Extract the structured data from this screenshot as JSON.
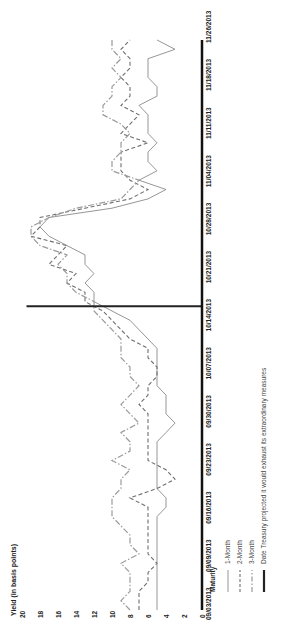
{
  "chart_data": {
    "type": "line",
    "title": "",
    "ylabel": "Yield (in basis points)",
    "xlabel": "",
    "ylim": [
      0,
      20
    ],
    "yticks": [
      0,
      2,
      4,
      6,
      8,
      10,
      12,
      14,
      16,
      18,
      20
    ],
    "grid": false,
    "orientation": "rotated -90deg (page rotated counter-clockwise)",
    "x_tick_labels": [
      "09/03/2013",
      "09/09/2013",
      "09/16/2013",
      "09/23/2013",
      "09/30/2013",
      "10/07/2013",
      "10/14/2013",
      "10/21/2013",
      "10/28/2013",
      "11/04/2013",
      "11/11/2013",
      "11/18/2013",
      "11/26/2013"
    ],
    "x_index_range": [
      0,
      61
    ],
    "legend": {
      "title": "Maturity",
      "position": "bottom",
      "entries": [
        {
          "label": "1-Month",
          "style": "solid",
          "color": "#8a8a8a"
        },
        {
          "label": "2-Month",
          "style": "dashed",
          "color": "#6e6e6e"
        },
        {
          "label": "3-Month",
          "style": "dash-dot",
          "color": "#9a9a9a"
        },
        {
          "label": "Date Treasury projected it would exhaust its extraordinary measures",
          "style": "thick-solid",
          "color": "#222222"
        }
      ]
    },
    "reference_line": {
      "label": "Date Treasury projected it would exhaust its extraordinary measures",
      "x_index": 32.5,
      "date_approx": "10/17/2013"
    },
    "series": [
      {
        "name": "1-Month",
        "values": [
          5,
          5,
          5,
          5,
          5,
          5,
          5,
          5,
          5,
          5,
          5,
          4,
          4,
          5,
          5,
          5,
          5,
          5,
          5,
          4,
          3,
          4,
          4,
          4,
          5,
          5,
          5,
          5,
          5,
          6,
          7,
          8,
          10,
          12,
          12,
          13,
          12,
          13,
          13,
          15,
          17,
          18,
          17,
          10,
          6,
          4,
          7,
          5,
          6,
          6,
          5,
          6,
          6,
          6,
          7,
          5,
          5,
          6,
          6,
          6,
          3,
          5
        ]
      },
      {
        "name": "2-Month",
        "values": [
          7,
          7,
          7,
          6,
          6,
          5,
          6,
          6,
          6,
          6,
          6,
          6,
          8,
          5,
          3,
          4,
          6,
          6,
          6,
          6,
          6,
          6,
          7,
          6,
          6,
          5,
          5,
          6,
          6,
          8,
          9,
          10,
          11,
          13,
          13,
          15,
          14,
          17,
          16,
          15,
          19,
          18,
          18,
          13,
          8,
          6,
          8,
          9,
          9,
          9,
          6,
          9,
          8,
          7,
          9,
          8,
          8,
          9,
          8,
          8,
          9,
          8
        ]
      },
      {
        "name": "3-Month",
        "values": [
          8,
          9,
          8,
          8,
          8,
          9,
          7,
          8,
          8,
          9,
          10,
          10,
          10,
          9,
          9,
          8,
          10,
          8,
          8,
          9,
          7,
          8,
          9,
          8,
          7,
          8,
          8,
          9,
          9,
          9,
          10,
          11,
          12,
          12,
          14,
          15,
          15,
          16,
          15,
          18,
          19,
          19,
          17,
          14,
          9,
          8,
          7,
          10,
          10,
          9,
          9,
          8,
          9,
          11,
          11,
          10,
          10,
          9,
          10,
          9,
          10,
          10
        ]
      }
    ]
  },
  "axis": {
    "ylabel": "Yield (in basis points)",
    "yticks": [
      "0",
      "2",
      "4",
      "6",
      "8",
      "10",
      "12",
      "14",
      "16",
      "18",
      "20"
    ],
    "xticks": [
      "09/03/2013",
      "09/09/2013",
      "09/16/2013",
      "09/23/2013",
      "09/30/2013",
      "10/07/2013",
      "10/14/2013",
      "10/21/2013",
      "10/28/2013",
      "11/04/2013",
      "11/11/2013",
      "11/18/2013",
      "11/26/2013"
    ]
  },
  "legend": {
    "title": "Maturity",
    "items": [
      "1-Month",
      "2-Month",
      "3-Month",
      "Date Treasury projected it would exhaust its extraordinary measures"
    ]
  },
  "colors": {
    "one_month": "#8a8a8a",
    "two_month": "#6e6e6e",
    "three_month": "#9a9a9a",
    "axis": "#111111",
    "reference": "#222222"
  }
}
